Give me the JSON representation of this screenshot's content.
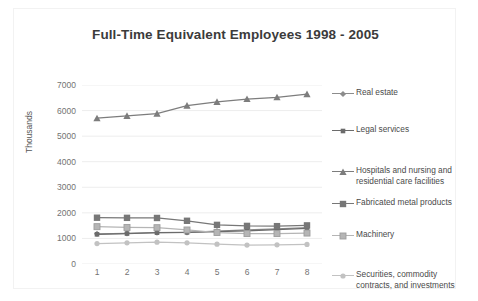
{
  "chart_data": {
    "type": "line",
    "title": "Full-Time Equivalent Employees 1998 - 2005",
    "xlabel": "",
    "ylabel": "Thousands",
    "categories": [
      "1",
      "2",
      "3",
      "4",
      "5",
      "6",
      "7",
      "8"
    ],
    "yticks": [
      "0",
      "1000",
      "2000",
      "3000",
      "4000",
      "5000",
      "6000",
      "7000"
    ],
    "ylim": [
      0,
      7000
    ],
    "grid": true,
    "legend_position": "right",
    "series": [
      {
        "name": "Real estate",
        "marker": "diamond",
        "color": "#8c8c8c",
        "values": [
          1180,
          1200,
          1230,
          1240,
          1290,
          1330,
          1370,
          1420
        ]
      },
      {
        "name": "Legal services",
        "marker": "square",
        "color": "#6b6b6b",
        "values": [
          1160,
          1190,
          1225,
          1235,
          1270,
          1300,
          1340,
          1395
        ]
      },
      {
        "name": "Hospitals and nursing and residential care facilities",
        "marker": "triangle",
        "color": "#7d7d7d",
        "values": [
          5700,
          5790,
          5880,
          6190,
          6340,
          6450,
          6520,
          6640
        ]
      },
      {
        "name": "Fabricated metal products",
        "marker": "square-large",
        "color": "#777777",
        "values": [
          1810,
          1805,
          1800,
          1690,
          1530,
          1490,
          1480,
          1510
        ]
      },
      {
        "name": "Machinery",
        "marker": "square-light",
        "color": "#b5b5b5",
        "values": [
          1460,
          1430,
          1420,
          1330,
          1230,
          1190,
          1190,
          1210
        ]
      },
      {
        "name": "Securities, commodity contracts, and investments",
        "marker": "circle",
        "color": "#c2c2c2",
        "values": [
          800,
          830,
          855,
          830,
          775,
          740,
          750,
          765
        ]
      }
    ]
  },
  "legend": {
    "entries": [
      {
        "label": "Real estate",
        "label2": ""
      },
      {
        "label": "Legal services",
        "label2": ""
      },
      {
        "label": "Hospitals and nursing and",
        "label2": "residential care facilities"
      },
      {
        "label": "Fabricated metal products",
        "label2": ""
      },
      {
        "label": "Machinery",
        "label2": ""
      },
      {
        "label": "Securities, commodity",
        "label2": "contracts, and investments"
      }
    ]
  },
  "colors": {
    "title": "#3b3b3b",
    "tick": "#737373",
    "grid": "#ededed",
    "frame": "#f2f2f2",
    "background": "#ffffff"
  }
}
